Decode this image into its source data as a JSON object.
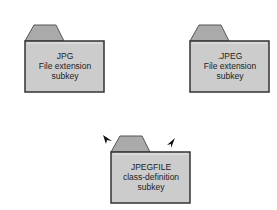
{
  "diagram": {
    "colors": {
      "folder_fill": "#cccccc",
      "tab_fill": "#aaaaaa",
      "border": "#333333",
      "text": "#222222"
    },
    "folders": [
      {
        "id": "jpg",
        "lines": [
          "JPG",
          "File extension",
          "subkey"
        ]
      },
      {
        "id": "jpeg",
        "lines": [
          ".JPEG",
          "File extension",
          "subkey"
        ]
      },
      {
        "id": "jpegfile",
        "lines": [
          "JPEGFILE",
          "class-definition",
          "subkey"
        ]
      }
    ],
    "annotations": {
      "arrow_left": "arrowhead-left",
      "arrow_right": "arrowhead-right"
    }
  }
}
